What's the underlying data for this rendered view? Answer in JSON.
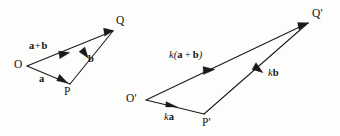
{
  "figure": {
    "background_color": "#fdfdfc",
    "ink_color": "#1a1a1a"
  },
  "left_triangle": {
    "name": "vector-triangle-OPQ",
    "points": [
      {
        "id": "O",
        "label": "O",
        "x": 27,
        "y": 66
      },
      {
        "id": "P",
        "label": "P",
        "x": 70,
        "y": 84
      },
      {
        "id": "Q",
        "label": "Q",
        "x": 113,
        "y": 31
      }
    ],
    "vectors": [
      {
        "id": "a",
        "label": "a",
        "from": "O",
        "to": "P",
        "label_x": 39,
        "label_y": 76
      },
      {
        "id": "b",
        "label": "b",
        "from": "P",
        "to": "Q",
        "label_x": 88,
        "label_y": 56
      },
      {
        "id": "a_plus_b",
        "label": "a + b",
        "from": "O",
        "to": "Q",
        "label_x": 29,
        "label_y": 42
      }
    ],
    "point_label_positions": {
      "O": {
        "x": 14,
        "y": 60
      },
      "P": {
        "x": 64,
        "y": 86
      },
      "Q": {
        "x": 116,
        "y": 16
      }
    }
  },
  "right_triangle": {
    "name": "vector-triangle-O-prime-P-prime-Q-prime",
    "points": [
      {
        "id": "O_prime",
        "label": "O'",
        "x": 146,
        "y": 100
      },
      {
        "id": "P_prime",
        "label": "P'",
        "x": 204,
        "y": 114
      },
      {
        "id": "Q_prime",
        "label": "Q'",
        "x": 308,
        "y": 23
      }
    ],
    "vectors": [
      {
        "id": "ka",
        "label": "ka",
        "from": "O_prime",
        "to": "P_prime",
        "label_x": 164,
        "label_y": 113
      },
      {
        "id": "kb",
        "label": "kb",
        "from": "P_prime",
        "to": "Q_prime",
        "label_x": 268,
        "label_y": 70
      },
      {
        "id": "k_a_plus_b",
        "label": "k(a + b)",
        "from": "O_prime",
        "to": "Q_prime",
        "label_x": 170,
        "label_y": 51
      }
    ],
    "point_label_positions": {
      "O_prime": {
        "x": 126,
        "y": 94
      },
      "P_prime": {
        "x": 203,
        "y": 117
      },
      "Q_prime": {
        "x": 312,
        "y": 9
      }
    }
  },
  "label_text": {
    "O": "O",
    "P": "P",
    "Q": "Q",
    "O_prime": "O'",
    "P_prime": "P'",
    "Q_prime": "Q'",
    "a": "a",
    "b": "b",
    "plus": "+",
    "a_plus_b_first": "a",
    "a_plus_b_second": "b",
    "k": "k",
    "k_open": "k(",
    "k_close": ")",
    "ka_k": "k",
    "ka_a": "a",
    "kb_k": "k",
    "kb_b": "b"
  }
}
